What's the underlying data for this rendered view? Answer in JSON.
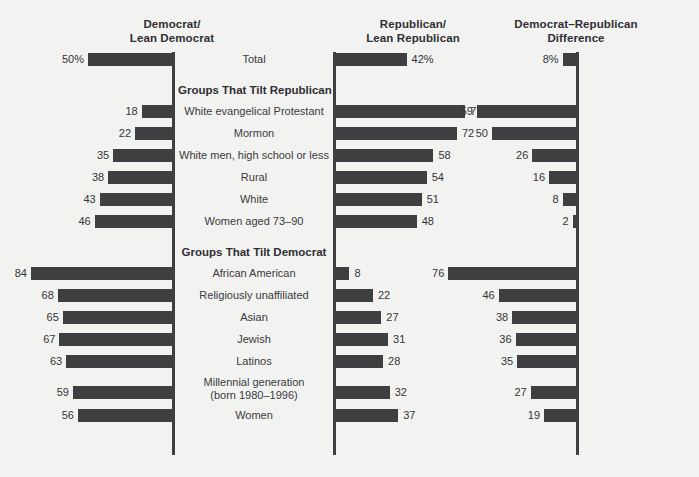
{
  "chart_data": {
    "type": "bar",
    "title": "",
    "subtitle": "",
    "xlabel": "",
    "ylabel": "",
    "grid": false,
    "legend_position": "none",
    "axis_range": [
      0,
      100
    ],
    "px_per_unit": 1.68,
    "columns": [
      {
        "key": "dem",
        "header_lines": [
          "Democrat/",
          "Lean Democrat"
        ],
        "direction": "left",
        "spine_x": 172
      },
      {
        "key": "rep",
        "header_lines": [
          "Republican/",
          "Lean Republican"
        ],
        "direction": "right",
        "spine_x": 333
      },
      {
        "key": "diff",
        "header_lines": [
          "Democrat–Republican",
          "Difference"
        ],
        "direction": "left",
        "spine_x": 576
      }
    ],
    "sections": [
      {
        "title": "",
        "rows": [
          {
            "label_lines": [
              "Total"
            ],
            "dem": 50,
            "rep": 42,
            "diff": 8,
            "dem_text": "50%",
            "rep_text": "42%",
            "diff_text": "8%"
          }
        ]
      },
      {
        "title": "Groups That Tilt Republican",
        "rows": [
          {
            "label_lines": [
              "White evangelical Protestant"
            ],
            "dem": 18,
            "rep": 77,
            "diff": 59,
            "dem_text": "18",
            "rep_text": "77",
            "diff_text": "59"
          },
          {
            "label_lines": [
              "Mormon"
            ],
            "dem": 22,
            "rep": 72,
            "diff": 50,
            "dem_text": "22",
            "rep_text": "72",
            "diff_text": "50"
          },
          {
            "label_lines": [
              "White men, high school or less"
            ],
            "dem": 35,
            "rep": 58,
            "diff": 26,
            "dem_text": "35",
            "rep_text": "58",
            "diff_text": "26"
          },
          {
            "label_lines": [
              "Rural"
            ],
            "dem": 38,
            "rep": 54,
            "diff": 16,
            "dem_text": "38",
            "rep_text": "54",
            "diff_text": "16"
          },
          {
            "label_lines": [
              "White"
            ],
            "dem": 43,
            "rep": 51,
            "diff": 8,
            "dem_text": "43",
            "rep_text": "51",
            "diff_text": "8"
          },
          {
            "label_lines": [
              "Women aged 73–90"
            ],
            "dem": 46,
            "rep": 48,
            "diff": 2,
            "dem_text": "46",
            "rep_text": "48",
            "diff_text": "2"
          }
        ]
      },
      {
        "title": "Groups That Tilt Democrat",
        "rows": [
          {
            "label_lines": [
              "African American"
            ],
            "dem": 84,
            "rep": 8,
            "diff": 76,
            "dem_text": "84",
            "rep_text": "8",
            "diff_text": "76"
          },
          {
            "label_lines": [
              "Religiously unaffiliated"
            ],
            "dem": 68,
            "rep": 22,
            "diff": 46,
            "dem_text": "68",
            "rep_text": "22",
            "diff_text": "46"
          },
          {
            "label_lines": [
              "Asian"
            ],
            "dem": 65,
            "rep": 27,
            "diff": 38,
            "dem_text": "65",
            "rep_text": "27",
            "diff_text": "38"
          },
          {
            "label_lines": [
              "Jewish"
            ],
            "dem": 67,
            "rep": 31,
            "diff": 36,
            "dem_text": "67",
            "rep_text": "31",
            "diff_text": "36"
          },
          {
            "label_lines": [
              "Latinos"
            ],
            "dem": 63,
            "rep": 28,
            "diff": 35,
            "dem_text": "63",
            "rep_text": "28",
            "diff_text": "35"
          },
          {
            "label_lines": [
              "Millennial generation",
              "(born 1980–1996)"
            ],
            "dem": 59,
            "rep": 32,
            "diff": 27,
            "dem_text": "59",
            "rep_text": "32",
            "diff_text": "27"
          },
          {
            "label_lines": [
              "Women"
            ],
            "dem": 56,
            "rep": 37,
            "diff": 19,
            "dem_text": "56",
            "rep_text": "37",
            "diff_text": "19"
          }
        ]
      }
    ],
    "colors": {
      "bar": "#3f3f42",
      "background": "#f2f2f0",
      "text": "#34343a",
      "axis": "#3f3f42"
    }
  }
}
